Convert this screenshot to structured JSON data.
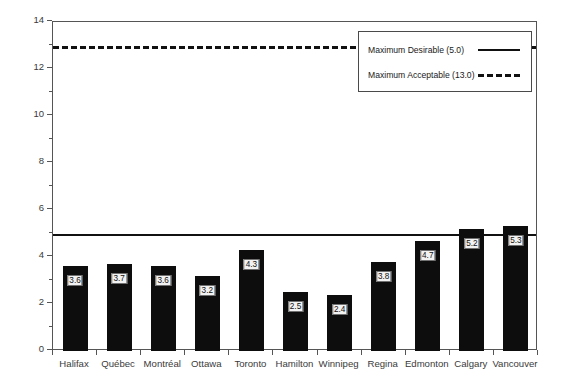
{
  "chart_data": {
    "type": "bar",
    "title": "",
    "subtitle": "",
    "xlabel": "",
    "ylabel": "Parts per Million",
    "ylim": [
      0,
      14
    ],
    "ytick_step": 2,
    "minor_ticks": true,
    "grid": false,
    "legend_position": "top-right",
    "categories": [
      "Halifax",
      "Québec",
      "Montréal",
      "Ottawa",
      "Toronto",
      "Hamilton",
      "Winnipeg",
      "Regina",
      "Edmonton",
      "Calgary",
      "Vancouver"
    ],
    "values": [
      3.6,
      3.7,
      3.6,
      3.2,
      4.3,
      2.5,
      2.4,
      3.8,
      4.7,
      5.2,
      5.3
    ],
    "value_labels": [
      "3.6",
      "3.7",
      "3.6",
      "3.2",
      "4.3",
      "2.5",
      "2.4",
      "3.8",
      "4.7",
      "5.2",
      "5.3"
    ],
    "ytick_labels": [
      "0",
      "2",
      "4",
      "6",
      "8",
      "10",
      "12",
      "14"
    ],
    "ytick_values": [
      0,
      2,
      4,
      6,
      8,
      10,
      12,
      14
    ],
    "minor_tick_values": [
      1,
      3,
      5,
      7,
      9,
      11,
      13
    ],
    "reference_lines": [
      {
        "name": "maximum-desirable",
        "label": "Maximum Desirable (5.0)",
        "value": 5.0,
        "style": "solid"
      },
      {
        "name": "maximum-acceptable",
        "label": "Maximum Acceptable (13.0)",
        "value": 13.0,
        "style": "dashed"
      }
    ],
    "colors": {
      "bar": "#0d0d0d",
      "axis": "#555555",
      "text": "#3a3a3a",
      "reference_line": "#111111",
      "value_label_background": "#f2f2f2"
    }
  },
  "legend": {
    "entries": [
      {
        "label": "Maximum Desirable (5.0)",
        "style": "solid"
      },
      {
        "label": "Maximum Acceptable (13.0)",
        "style": "dashed"
      }
    ]
  }
}
